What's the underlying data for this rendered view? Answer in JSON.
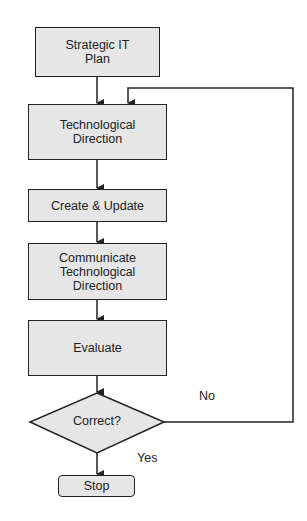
{
  "nodes": {
    "strategic": {
      "label": "Strategic IT\nPlan"
    },
    "tech_direction": {
      "label": "Technological\nDirection"
    },
    "create_update": {
      "label": "Create & Update"
    },
    "communicate": {
      "label": "Communicate\nTechnological\nDirection"
    },
    "evaluate": {
      "label": "Evaluate"
    },
    "decision": {
      "label": "Correct?"
    },
    "stop": {
      "label": "Stop"
    }
  },
  "edges": {
    "no_label": "No",
    "yes_label": "Yes"
  },
  "colors": {
    "box_fill": "#e6e6e6",
    "stroke": "#222222"
  }
}
